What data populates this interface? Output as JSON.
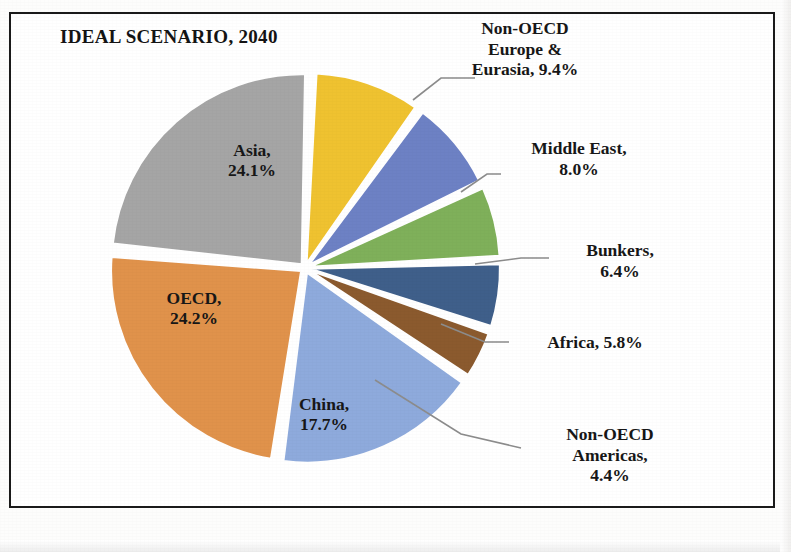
{
  "chart_data": {
    "type": "pie",
    "title": "IDEAL SCENARIO, 2040",
    "xlabel": "",
    "ylabel": "",
    "legend": "none",
    "grid": false,
    "label_format": "name, percent",
    "categories": [
      "Asia",
      "Non-OECD Europe & Eurasia",
      "Middle East",
      "Bunkers",
      "Africa",
      "Non-OECD Americas",
      "China",
      "OECD"
    ],
    "values": [
      24.1,
      9.4,
      8.0,
      6.4,
      5.8,
      4.4,
      17.7,
      24.2
    ],
    "slices": [
      {
        "id": "asia",
        "name": "Asia",
        "value": 24.1,
        "value_text": "24.1%",
        "label": "Asia,\n24.1%",
        "color": "#A5A5A5",
        "label_placement": "inside"
      },
      {
        "id": "non-oecd-europe-eurasia",
        "name": "Non-OECD Europe & Eurasia",
        "value": 9.4,
        "value_text": "9.4%",
        "label": "Non-OECD\nEurope &\nEurasia, 9.4%",
        "color": "#EFC230",
        "label_placement": "outside"
      },
      {
        "id": "middle-east",
        "name": "Middle East",
        "value": 8.0,
        "value_text": "8.0%",
        "label": "Middle East,\n8.0%",
        "color": "#6D81C4",
        "label_placement": "outside"
      },
      {
        "id": "bunkers",
        "name": "Bunkers",
        "value": 6.4,
        "value_text": "6.4%",
        "label": "Bunkers,\n6.4%",
        "color": "#7FB05A",
        "label_placement": "outside"
      },
      {
        "id": "africa",
        "name": "Africa",
        "value": 5.8,
        "value_text": "5.8%",
        "label": "Africa, 5.8%",
        "color": "#3F5F8A",
        "label_placement": "outside"
      },
      {
        "id": "non-oecd-americas",
        "name": "Non-OECD Americas",
        "value": 4.4,
        "value_text": "4.4%",
        "label": "Non-OECD\nAmericas,\n4.4%",
        "color": "#8B5A2E",
        "label_placement": "outside"
      },
      {
        "id": "china",
        "name": "China",
        "value": 17.7,
        "value_text": "17.7%",
        "label": "China,\n17.7%",
        "color": "#8EAADC",
        "label_placement": "inside"
      },
      {
        "id": "oecd",
        "name": "OECD",
        "value": 24.2,
        "value_text": "24.2%",
        "label": "OECD,\n24.2%",
        "color": "#E0924B",
        "label_placement": "inside"
      }
    ]
  }
}
